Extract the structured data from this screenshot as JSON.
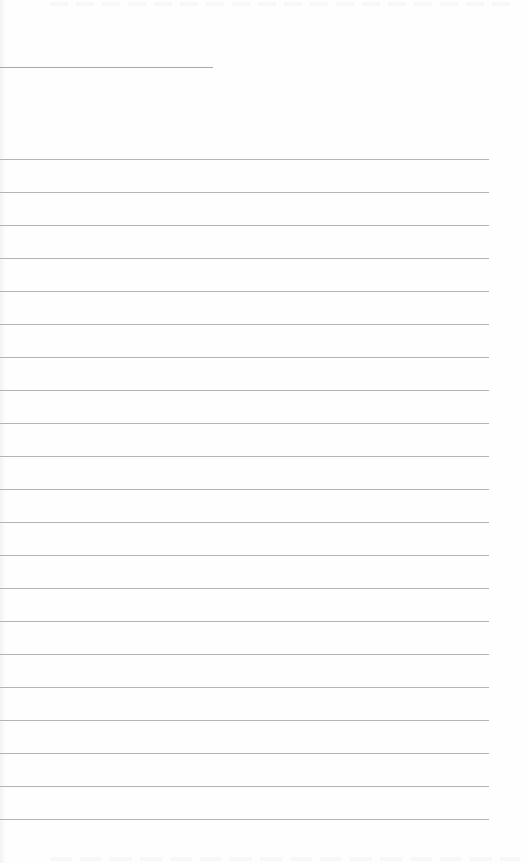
{
  "document": {
    "type": "ruled-blank-page",
    "background": "#fefefe",
    "line_color": "#b4b4b4",
    "header_line": {
      "top": 67,
      "width": 213
    },
    "rules": {
      "count": 21,
      "first_top": 159,
      "spacing": 33,
      "width": 489
    }
  }
}
